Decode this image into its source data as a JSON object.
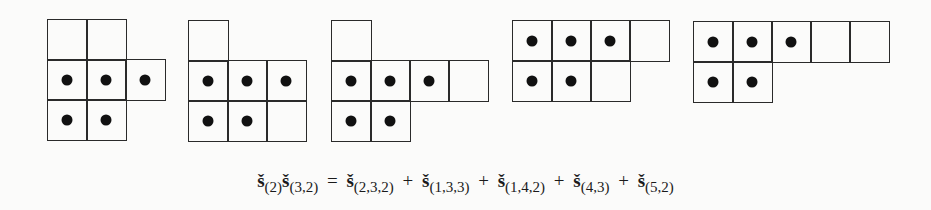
{
  "figure": {
    "cell_size": 39,
    "diagrams": [
      {
        "name": "diagram-2-3-2",
        "x": 47,
        "y": 19,
        "rows": [
          {
            "cells": 2,
            "dotted": 0
          },
          {
            "cells": 3,
            "dotted": 3
          },
          {
            "cells": 2,
            "dotted": 2
          }
        ]
      },
      {
        "name": "diagram-1-3-3",
        "x": 188,
        "y": 20,
        "rows": [
          {
            "cells": 1,
            "dotted": 0
          },
          {
            "cells": 3,
            "dotted": 3
          },
          {
            "cells": 3,
            "dotted": 2
          }
        ]
      },
      {
        "name": "diagram-1-4-2",
        "x": 331,
        "y": 20,
        "rows": [
          {
            "cells": 1,
            "dotted": 0
          },
          {
            "cells": 4,
            "dotted": 3
          },
          {
            "cells": 2,
            "dotted": 2
          }
        ]
      },
      {
        "name": "diagram-4-3",
        "x": 512,
        "y": 20,
        "rows": [
          {
            "cells": 4,
            "dotted": 3
          },
          {
            "cells": 3,
            "dotted": 2
          }
        ]
      },
      {
        "name": "diagram-5-2",
        "x": 693,
        "y": 21,
        "rows": [
          {
            "cells": 5,
            "dotted": 3
          },
          {
            "cells": 2,
            "dotted": 2
          }
        ]
      }
    ]
  },
  "equation": {
    "symbol": "š",
    "lhs": [
      {
        "sub": "(2)"
      },
      {
        "sub": "(3,2)"
      }
    ],
    "equals": "=",
    "plus": "+",
    "rhs": [
      {
        "sub": "(2,3,2)"
      },
      {
        "sub": "(1,3,3)"
      },
      {
        "sub": "(1,4,2)"
      },
      {
        "sub": "(4,3)"
      },
      {
        "sub": "(5,2)"
      }
    ]
  }
}
